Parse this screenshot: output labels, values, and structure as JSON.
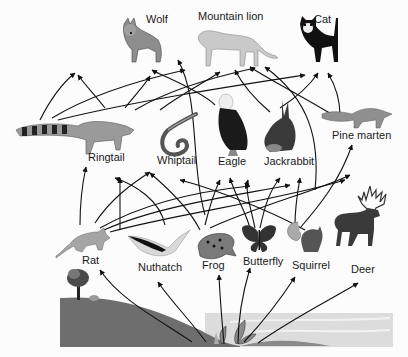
{
  "diagram": {
    "type": "food-web",
    "colors": {
      "background": "#fcfcfc",
      "arrow": "#111111",
      "hill": "#6e6e6e",
      "water": "#d4d4d4",
      "label": "#1a1a1a"
    },
    "producers": [
      {
        "id": "plants",
        "label": "",
        "icon": "plant-icon"
      },
      {
        "id": "tree",
        "label": "",
        "icon": "tree-icon"
      }
    ],
    "organisms": [
      {
        "id": "wolf",
        "label": "Wolf",
        "icon": "wolf-icon",
        "level": "top"
      },
      {
        "id": "mountain-lion",
        "label": "Mountain lion",
        "icon": "mountain-lion-icon",
        "level": "top"
      },
      {
        "id": "cat",
        "label": "Cat",
        "icon": "cat-icon",
        "level": "top"
      },
      {
        "id": "ringtail",
        "label": "Ringtail",
        "icon": "ringtail-icon",
        "level": "middle"
      },
      {
        "id": "whiptail",
        "label": "Whiptail",
        "icon": "whiptail-lizard-icon",
        "level": "middle"
      },
      {
        "id": "eagle",
        "label": "Eagle",
        "icon": "eagle-icon",
        "level": "middle"
      },
      {
        "id": "jackrabbit",
        "label": "Jackrabbit",
        "icon": "jackrabbit-icon",
        "level": "middle"
      },
      {
        "id": "pine-marten",
        "label": "Pine marten",
        "icon": "pine-marten-icon",
        "level": "middle"
      },
      {
        "id": "rat",
        "label": "Rat",
        "icon": "rat-icon",
        "level": "bottom"
      },
      {
        "id": "nuthatch",
        "label": "Nuthatch",
        "icon": "nuthatch-icon",
        "level": "bottom"
      },
      {
        "id": "frog",
        "label": "Frog",
        "icon": "frog-icon",
        "level": "bottom"
      },
      {
        "id": "butterfly",
        "label": "Butterfly",
        "icon": "butterfly-icon",
        "level": "bottom"
      },
      {
        "id": "squirrel",
        "label": "Squirrel",
        "icon": "squirrel-icon",
        "level": "bottom"
      },
      {
        "id": "deer",
        "label": "Deer",
        "icon": "deer-icon",
        "level": "bottom"
      }
    ],
    "labels": {
      "wolf": "Wolf",
      "mountain_lion": "Mountain lion",
      "cat": "Cat",
      "ringtail": "Ringtail",
      "whiptail": "Whiptail",
      "eagle": "Eagle",
      "jackrabbit": "Jackrabbit",
      "pine_marten": "Pine marten",
      "rat": "Rat",
      "nuthatch": "Nuthatch",
      "frog": "Frog",
      "butterfly": "Butterfly",
      "squirrel": "Squirrel",
      "deer": "Deer"
    },
    "arrows_from_plants": [
      "rat",
      "nuthatch",
      "frog",
      "butterfly",
      "squirrel",
      "deer"
    ],
    "arrow_count_approx": 40
  }
}
